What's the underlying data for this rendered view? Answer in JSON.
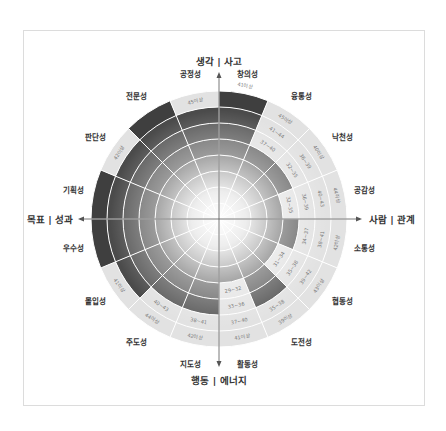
{
  "chart_data": {
    "type": "radial-sector",
    "title": "",
    "axes": {
      "top": "생각 | 사고",
      "right": "사람 | 관계",
      "bottom": "행동 | 에너지",
      "left": "목표 | 성과"
    },
    "rings": 8,
    "sectors": [
      {
        "name": "창의성",
        "level": 8,
        "ranges": [
          "41이상"
        ]
      },
      {
        "name": "융통성",
        "level": 5,
        "ranges": [
          "37~40",
          "41~44",
          "45이상"
        ]
      },
      {
        "name": "낙천성",
        "level": 5,
        "ranges": [
          "32~35",
          "36~39",
          "40이상"
        ]
      },
      {
        "name": "공감성",
        "level": 4,
        "ranges": [
          "32~35",
          "36~39",
          "40~43",
          "44이상"
        ]
      },
      {
        "name": "소통성",
        "level": 5,
        "ranges": [
          "34~37",
          "38~41",
          "42이상"
        ]
      },
      {
        "name": "협동성",
        "level": 4,
        "ranges": [
          "31~34",
          "35~38",
          "39~42",
          "43이상"
        ]
      },
      {
        "name": "도전성",
        "level": 6,
        "ranges": [
          "35~38",
          "39이상"
        ]
      },
      {
        "name": "활동성",
        "level": 4,
        "ranges": [
          "29~32",
          "33~36",
          "37~40",
          "41이상"
        ]
      },
      {
        "name": "지도성",
        "level": 6,
        "ranges": [
          "38~41",
          "42이상"
        ]
      },
      {
        "name": "주도성",
        "level": 6,
        "ranges": [
          "40~43",
          "44이상"
        ]
      },
      {
        "name": "몰입성",
        "level": 7,
        "ranges": [
          "41이상"
        ]
      },
      {
        "name": "우수성",
        "level": 8,
        "ranges": []
      },
      {
        "name": "기획성",
        "level": 8,
        "ranges": []
      },
      {
        "name": "판단성",
        "level": 7,
        "ranges": [
          "42이상"
        ]
      },
      {
        "name": "전문성",
        "level": 8,
        "ranges": []
      },
      {
        "name": "공정성",
        "level": 7,
        "ranges": [
          "45이상"
        ]
      }
    ],
    "colors": {
      "dark": "#3a3a3a",
      "light_ring": "#e2e2e2",
      "center": "#ffffff",
      "grid": "#ffffff"
    }
  }
}
